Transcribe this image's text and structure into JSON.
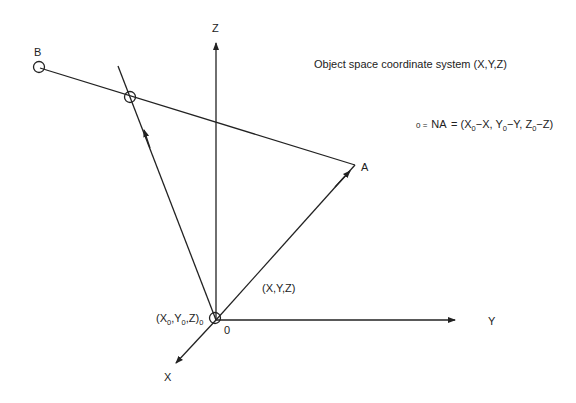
{
  "title": "Object space coordinate system (X,Y,Z)",
  "equation": {
    "prefix": "0 =",
    "lhs": "NA",
    "rhs_parts": [
      "(X",
      "0",
      "−X, Y",
      "0",
      "−Y, Z",
      "0",
      "−Z)"
    ]
  },
  "axes": {
    "z_label": "Z",
    "y_label": "Y",
    "x_label": "X"
  },
  "points": {
    "a_label": "A",
    "b_label": "B",
    "origin_label": "0",
    "vector_label": "(X,Y,Z)",
    "center": {
      "p1": "(X",
      "s1": "0",
      "p2": ",Y",
      "s2": "0",
      "p3": ",Z)",
      "s3": "0"
    }
  },
  "colors": {
    "line": "#222222",
    "background": "#ffffff"
  }
}
